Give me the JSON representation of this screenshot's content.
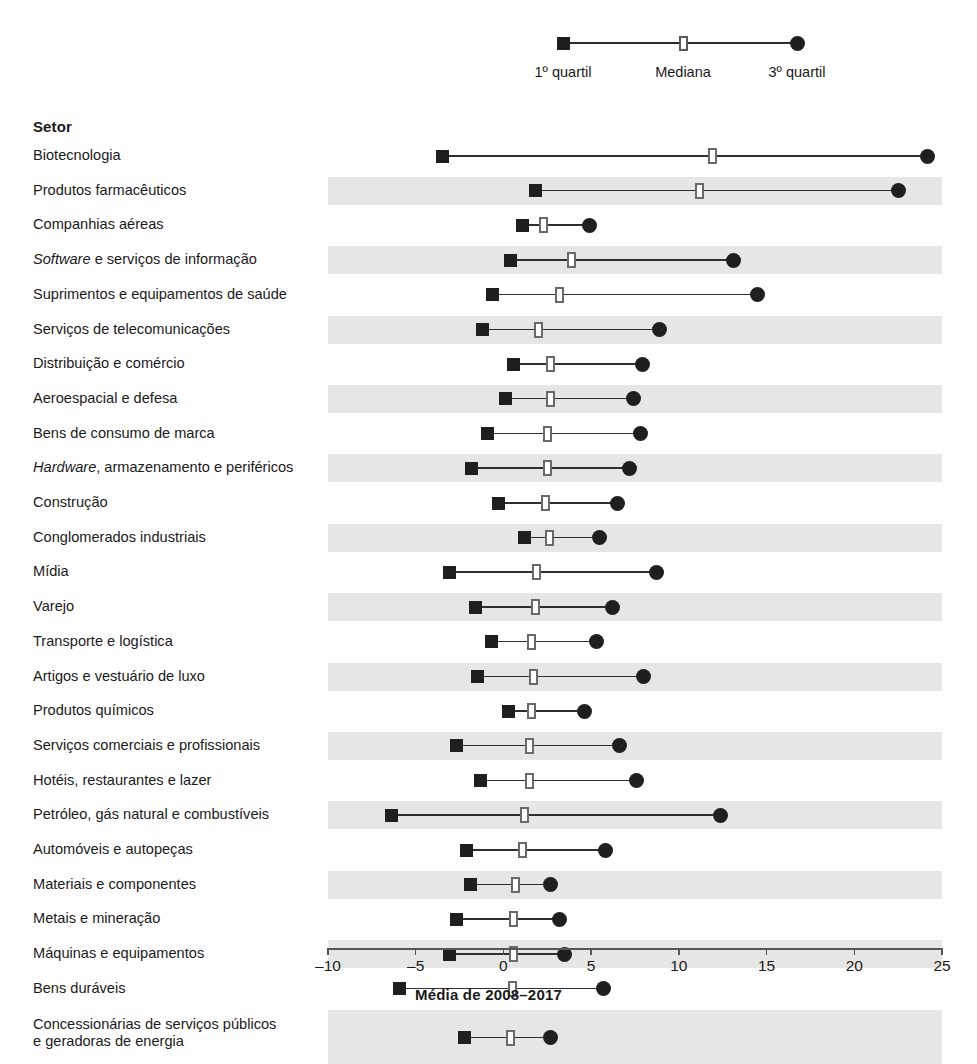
{
  "legend": {
    "q1_label": "1º quartil",
    "median_label": "Mediana",
    "q3_label": "3º quartil",
    "q1_x": 0.0,
    "median_x": 12.5,
    "q3_x": 25.0,
    "marker_q1": "filled-square",
    "marker_median": "open-rectangle",
    "marker_q3": "filled-circle"
  },
  "header": {
    "sector_column": "Setor"
  },
  "colors": {
    "marker_dark": "#1f1f1f",
    "median_outline": "#6a6a6a",
    "whisker": "#2e2e2e",
    "band": "#e6e6e6",
    "axis": "#565656",
    "text": "#1a1a1a"
  },
  "chart_data": {
    "type": "range",
    "title": "",
    "xlabel": "Média de 2008–2017",
    "ylabel": "Setor",
    "xlim": [
      -10,
      25
    ],
    "xticks": [
      -10,
      -5,
      0,
      5,
      10,
      15,
      20,
      25
    ],
    "xticklabels": [
      "–10",
      "–5",
      "0",
      "5",
      "10",
      "15",
      "20",
      "25"
    ],
    "grid": false,
    "legend_position": "top",
    "series": [
      {
        "name": "1º quartil",
        "marker": "filled-square"
      },
      {
        "name": "Mediana",
        "marker": "open-rectangle"
      },
      {
        "name": "3º quartil",
        "marker": "filled-circle"
      }
    ],
    "categories": [
      "Biotecnologia",
      "Produtos farmacêuticos",
      "Companhias aéreas",
      "Software e serviços de informação",
      "Suprimentos e equipamentos de saúde",
      "Serviços de telecomunicações",
      "Distribuição e comércio",
      "Aeroespacial e defesa",
      "Bens de consumo de marca",
      "Hardware, armazenamento e periféricos",
      "Construção",
      "Conglomerados industriais",
      "Mídia",
      "Varejo",
      "Transporte e logística",
      "Artigos e vestuário de luxo",
      "Produtos químicos",
      "Serviços comerciais e profissionais",
      "Hotéis, restaurantes e lazer",
      "Petróleo, gás natural e combustíveis",
      "Automóveis e autopeças",
      "Materiais e componentes",
      "Metais e mineração",
      "Máquinas e equipamentos",
      "Bens duráveis",
      "Concessionárias de serviços públicos e geradoras de energia"
    ],
    "rows": [
      {
        "label_html": "Biotecnologia",
        "q1": -3.5,
        "median": 11.9,
        "q3": 24.2,
        "band": false
      },
      {
        "label_html": "Produtos farmacêuticos",
        "q1": 1.8,
        "median": 11.2,
        "q3": 22.5,
        "band": true
      },
      {
        "label_html": "Companhias aéreas",
        "q1": 1.1,
        "median": 2.3,
        "q3": 4.9,
        "band": false
      },
      {
        "label_html": "<i>Software</i> e serviços de informação",
        "q1": 0.4,
        "median": 3.9,
        "q3": 13.1,
        "band": true
      },
      {
        "label_html": "Suprimentos e equipamentos de saúde",
        "q1": -0.6,
        "median": 3.2,
        "q3": 14.5,
        "band": false
      },
      {
        "label_html": "Serviços de telecomunicações",
        "q1": -1.2,
        "median": 2.0,
        "q3": 8.9,
        "band": true
      },
      {
        "label_html": "Distribuição e comércio",
        "q1": 0.6,
        "median": 2.7,
        "q3": 7.9,
        "band": false
      },
      {
        "label_html": "Aeroespacial e defesa",
        "q1": 0.1,
        "median": 2.7,
        "q3": 7.4,
        "band": true
      },
      {
        "label_html": "Bens de consumo de marca",
        "q1": -0.9,
        "median": 2.5,
        "q3": 7.8,
        "band": false
      },
      {
        "label_html": "<i>Hardware</i>, armazenamento e periféricos",
        "q1": -1.8,
        "median": 2.5,
        "q3": 7.2,
        "band": true
      },
      {
        "label_html": "Construção",
        "q1": -0.3,
        "median": 2.4,
        "q3": 6.5,
        "band": false
      },
      {
        "label_html": "Conglomerados industriais",
        "q1": 1.2,
        "median": 2.6,
        "q3": 5.5,
        "band": true
      },
      {
        "label_html": "Mídia",
        "q1": -3.1,
        "median": 1.9,
        "q3": 8.7,
        "band": false
      },
      {
        "label_html": "Varejo",
        "q1": -1.6,
        "median": 1.8,
        "q3": 6.2,
        "band": true
      },
      {
        "label_html": "Transporte e logística",
        "q1": -0.7,
        "median": 1.6,
        "q3": 5.3,
        "band": false
      },
      {
        "label_html": "Artigos e vestuário de luxo",
        "q1": -1.5,
        "median": 1.7,
        "q3": 8.0,
        "band": true
      },
      {
        "label_html": "Produtos químicos",
        "q1": 0.3,
        "median": 1.6,
        "q3": 4.6,
        "band": false
      },
      {
        "label_html": "Serviços comerciais e profissionais",
        "q1": -2.7,
        "median": 1.5,
        "q3": 6.6,
        "band": true
      },
      {
        "label_html": "Hotéis, restaurantes e lazer",
        "q1": -1.3,
        "median": 1.5,
        "q3": 7.6,
        "band": false
      },
      {
        "label_html": "Petróleo, gás natural e combustíveis",
        "q1": -6.4,
        "median": 1.2,
        "q3": 12.4,
        "band": true
      },
      {
        "label_html": "Automóveis e autopeças",
        "q1": -2.1,
        "median": 1.1,
        "q3": 5.8,
        "band": false
      },
      {
        "label_html": "Materiais e componentes",
        "q1": -1.9,
        "median": 0.7,
        "q3": 2.7,
        "band": true
      },
      {
        "label_html": "Metais e mineração",
        "q1": -2.7,
        "median": 0.6,
        "q3": 3.2,
        "band": false
      },
      {
        "label_html": "Máquinas e equipamentos",
        "q1": -3.1,
        "median": 0.6,
        "q3": 3.5,
        "band": true
      },
      {
        "label_html": "Bens duráveis",
        "q1": -5.9,
        "median": 0.5,
        "q3": 5.7,
        "band": false
      },
      {
        "label_html": "Concessionárias de serviços públicos<br>e geradoras de energia",
        "q1": -2.2,
        "median": 0.4,
        "q3": 2.7,
        "band": true
      }
    ]
  }
}
